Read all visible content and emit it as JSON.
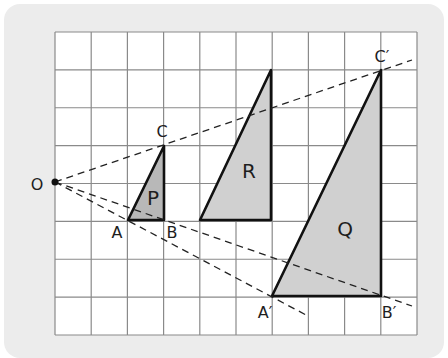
{
  "diagram": {
    "type": "enlargement",
    "grid": {
      "cols": 10,
      "rows": 8,
      "x0": 55,
      "y0": 32,
      "x1": 417,
      "y1": 335,
      "line_color": "#8a8a8a",
      "bg": "#ffffff"
    },
    "centre": {
      "label": "O",
      "x": 55,
      "y": 182
    },
    "triangles": [
      {
        "name": "P",
        "points": [
          [
            128,
            220
          ],
          [
            164,
            220
          ],
          [
            164,
            146
          ]
        ],
        "label_pos": [
          153,
          205
        ],
        "fill": "#b8b8b8"
      },
      {
        "name": "R",
        "points": [
          [
            200,
            220
          ],
          [
            271,
            220
          ],
          [
            271,
            70
          ]
        ],
        "label_pos": [
          249,
          178
        ],
        "fill": "#d0d0d0"
      },
      {
        "name": "Q",
        "points": [
          [
            272,
            296
          ],
          [
            381,
            296
          ],
          [
            381,
            70
          ]
        ],
        "label_pos": [
          345,
          236
        ],
        "fill": "#d0d0d0"
      }
    ],
    "vertex_labels": [
      {
        "text": "C",
        "x": 162,
        "y": 137
      },
      {
        "text": "A",
        "x": 117,
        "y": 238
      },
      {
        "text": "B",
        "x": 172,
        "y": 238
      },
      {
        "text": "A′",
        "x": 265,
        "y": 318
      },
      {
        "text": "B′",
        "x": 389,
        "y": 318
      },
      {
        "text": "C′",
        "x": 382,
        "y": 62
      },
      {
        "text": "O",
        "x": 37,
        "y": 190
      }
    ],
    "rays": [
      {
        "name": "ray-O-C-C'",
        "from": [
          55,
          182
        ],
        "to": [
          412,
          60
        ]
      },
      {
        "name": "ray-O-A-A'",
        "from": [
          55,
          182
        ],
        "to": [
          308,
          316
        ]
      },
      {
        "name": "ray-O-B-B'",
        "from": [
          55,
          182
        ],
        "to": [
          412,
          306
        ]
      }
    ]
  }
}
